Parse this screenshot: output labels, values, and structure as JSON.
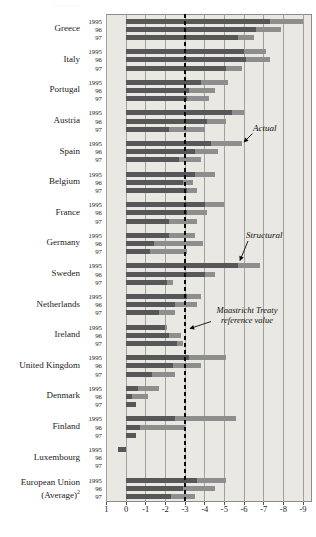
{
  "caption_fragment": ". . . . . . .",
  "colors": {
    "panel_bg": "#e9e8e3",
    "gridline": "#a2a29c",
    "bar_actual": "#8e8e8e",
    "bar_structural": "#57575a",
    "reference_line": "#0a0a0a"
  },
  "chart_data": {
    "type": "bar",
    "orientation": "horizontal",
    "title": "",
    "xlabel": "",
    "ylabel": "",
    "axis_ticks": [
      1,
      0,
      -1,
      -2,
      -3,
      -4,
      -5,
      -6,
      -7,
      -8,
      -9
    ],
    "xlim": [
      1,
      -9.4
    ],
    "grid": true,
    "years": [
      "1995",
      "96",
      "97"
    ],
    "legend": {
      "actual_label": "Actual",
      "structural_label": "Structural",
      "reference_label_line1": "Maastricht Treaty",
      "reference_label_line2": "reference value"
    },
    "reference_line_value": -3,
    "series_note": "actual = total bar tip (light gray), structural = dark gray segment from zero",
    "countries": [
      {
        "name": "Greece",
        "actual": [
          -9.0,
          -7.9,
          -6.5
        ],
        "structural": [
          -7.3,
          -6.6,
          -5.7
        ]
      },
      {
        "name": "Italy",
        "actual": [
          -7.1,
          -7.3,
          -5.9
        ],
        "structural": [
          -6.0,
          -6.1,
          -5.1
        ]
      },
      {
        "name": "Portugal",
        "actual": [
          -5.2,
          -4.5,
          -4.2
        ],
        "structural": [
          -3.8,
          -3.2,
          -3.1
        ]
      },
      {
        "name": "Austria",
        "actual": [
          -6.0,
          -5.1,
          -4.0
        ],
        "structural": [
          -5.4,
          -4.1,
          -2.2
        ]
      },
      {
        "name": "Spain",
        "actual": [
          -5.9,
          -4.7,
          -3.8
        ],
        "structural": [
          -4.3,
          -3.5,
          -2.7
        ]
      },
      {
        "name": "Belgium",
        "actual": [
          -4.5,
          -3.4,
          -3.6
        ],
        "structural": [
          -3.5,
          -2.9,
          -3.1
        ]
      },
      {
        "name": "France",
        "actual": [
          -5.0,
          -4.1,
          -3.6
        ],
        "structural": [
          -4.0,
          -3.1,
          -2.2
        ]
      },
      {
        "name": "Germany",
        "actual": [
          -3.5,
          -3.9,
          -3.1
        ],
        "structural": [
          -2.2,
          -1.4,
          -1.2
        ]
      },
      {
        "name": "Sweden",
        "actual": [
          -6.8,
          -4.5,
          -2.4
        ],
        "structural": [
          -5.7,
          -4.0,
          -2.1
        ]
      },
      {
        "name": "Netherlands",
        "actual": [
          -3.8,
          -3.6,
          -2.5
        ],
        "structural": [
          -3.1,
          -2.5,
          -1.7
        ]
      },
      {
        "name": "Ireland",
        "actual": [
          -2.1,
          -2.8,
          -2.9
        ],
        "structural": [
          -2.0,
          -2.2,
          -2.6
        ]
      },
      {
        "name": "United Kingdom",
        "actual": [
          -5.1,
          -3.8,
          -2.5
        ],
        "structural": [
          -3.2,
          -2.4,
          -1.3
        ]
      },
      {
        "name": "Denmark",
        "actual": [
          -1.7,
          -1.1,
          -0.4
        ],
        "structural": [
          -0.6,
          -0.3,
          -0.5
        ]
      },
      {
        "name": "Finland",
        "actual": [
          -5.6,
          -3.0,
          -0.4
        ],
        "structural": [
          -2.5,
          -0.7,
          -0.5
        ]
      },
      {
        "name": "Luxembourg",
        "actual": [
          0.4,
          null,
          null
        ],
        "structural": [
          0.4,
          null,
          null
        ]
      },
      {
        "name": "European Union",
        "name_line2": "(Average)",
        "name_sup": "2",
        "actual": [
          -5.1,
          -4.5,
          -3.5
        ],
        "structural": [
          -3.6,
          -2.9,
          -2.3
        ]
      }
    ]
  }
}
